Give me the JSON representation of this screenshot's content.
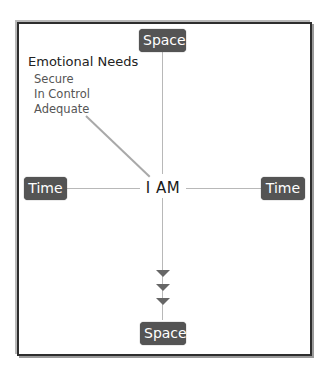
{
  "diagram": {
    "center_label": "I AM",
    "axes": {
      "top": {
        "label": "Space"
      },
      "bottom": {
        "label": "Space"
      },
      "left": {
        "label": "Time"
      },
      "right": {
        "label": "Time"
      }
    },
    "emotional_needs": {
      "title": "Emotional Needs",
      "items": [
        "Secure",
        "In Control",
        "Adequate"
      ]
    },
    "downward_arrows": 3,
    "colors": {
      "label_box": "#545454",
      "label_text": "#ffffff",
      "axis_line": "#b8b8b8",
      "arrow": "#666666",
      "frame": "#2e2e2e"
    }
  }
}
